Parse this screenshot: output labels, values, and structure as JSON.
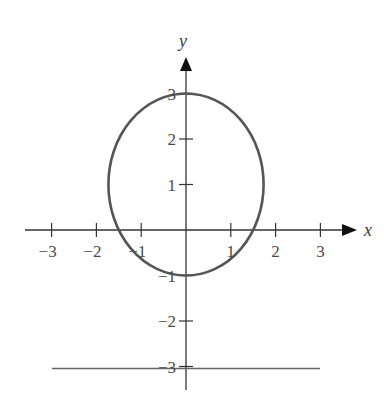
{
  "chart_data": {
    "type": "line",
    "title": "",
    "xlabel": "x",
    "ylabel": "y",
    "xlim": [
      -3.5,
      3.8
    ],
    "ylim": [
      -3.6,
      3.8
    ],
    "grid": false,
    "legend": null,
    "x_ticks": [
      -3,
      -2,
      -1,
      1,
      2,
      3
    ],
    "x_tick_labels": [
      "−3",
      "−2",
      "−1",
      "1",
      "2",
      "3"
    ],
    "y_ticks": [
      3,
      2,
      1,
      -1,
      -2,
      -3
    ],
    "y_tick_labels": [
      "3",
      "2",
      "1",
      "−1",
      "−2",
      "−3"
    ],
    "series": [
      {
        "name": "ellipse",
        "kind": "ellipse",
        "center": [
          0,
          1
        ],
        "semi_axis_x": 1.732,
        "semi_axis_y": 2,
        "equation": "x^2/3 + (y-1)^2/4 = 1",
        "color": "#555555"
      },
      {
        "name": "horizontal-line",
        "kind": "line",
        "y": -3,
        "x_range": [
          -3,
          3
        ],
        "color": "#666666"
      }
    ]
  },
  "colors": {
    "axis": "#333333",
    "curve": "#555555",
    "line": "#666666",
    "text": "#4a4a4a"
  }
}
